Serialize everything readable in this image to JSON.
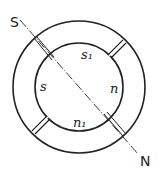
{
  "diagram": {
    "type": "ring-magnet-with-pole-line",
    "line_labels": {
      "start": "S",
      "end": "N"
    },
    "inner_labels": {
      "top": "s₁",
      "left": "s",
      "right": "n",
      "bottom": "n₁"
    },
    "stroke_color": "#222222",
    "background": "#ffffff"
  }
}
